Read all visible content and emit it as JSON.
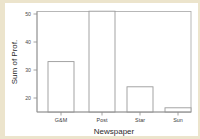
{
  "figure": {
    "background_color": "#ece4cc",
    "plot_background_color": "#ffffff",
    "frame_color": "#b0b0b0",
    "bar_outline_color": "#9a9a9a",
    "bar_fill_color": "#ffffff"
  },
  "chart_data": {
    "type": "bar",
    "title": "",
    "subtitle": "",
    "categories": [
      "G&M",
      "Post",
      "Star",
      "Sun"
    ],
    "values": [
      33,
      51,
      24,
      16.5
    ],
    "series": [
      {
        "name": "Sum of Prof.",
        "values": [
          33,
          51,
          24,
          16.5
        ]
      }
    ],
    "xlabel": "Newspaper",
    "ylabel": "Sum of Prof.",
    "ylim": [
      15.5,
      52.5
    ],
    "yticks": [
      20,
      30,
      40,
      50
    ],
    "ytick_labels": [
      "20",
      "30",
      "40",
      "50"
    ],
    "xtick_labels": [
      "G&M",
      "Post",
      "Star",
      "Sun"
    ],
    "grid": false,
    "legend": false,
    "legend_position": "none",
    "annotations": [],
    "bar_style": "outlined-unfilled"
  },
  "axes": {
    "y_title": "Sum of Prof.",
    "x_title": "Newspaper",
    "y_tick_0": "20",
    "y_tick_1": "30",
    "y_tick_2": "40",
    "y_tick_3": "50",
    "x_cat_0": "G&M",
    "x_cat_1": "Post",
    "x_cat_2": "Star",
    "x_cat_3": "Sun"
  }
}
